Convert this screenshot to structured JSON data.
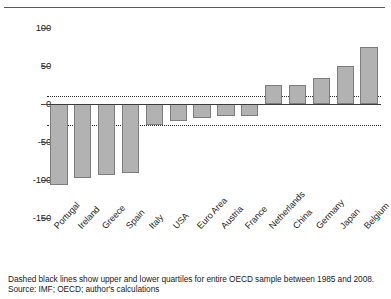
{
  "chart_data": {
    "type": "bar",
    "title": "",
    "subtitle": "",
    "xlabel": "",
    "ylabel": "",
    "categories": [
      "Portugal",
      "Ireland",
      "Greece",
      "Spain",
      "Italy",
      "USA",
      "Euro Area",
      "Austria",
      "France",
      "Netherlands",
      "China",
      "Germany",
      "Japan",
      "Belgium"
    ],
    "values": [
      -106,
      -98,
      -93,
      -91,
      -28,
      -22,
      -18,
      -16,
      -16,
      25,
      25,
      34,
      50,
      75
    ],
    "ylim": [
      -150,
      100
    ],
    "yticks": [
      100,
      50,
      0,
      -50,
      -100,
      -150
    ],
    "ytick_labels": [
      "100",
      "50",
      "0",
      "-50",
      "-100",
      "-150"
    ],
    "grid": false,
    "legend": "none",
    "bar_color": "#b2b2b2",
    "bar_edge_color": "#7d7d7d",
    "axis_color": "#3c3c3e",
    "annotations": [
      {
        "name": "upper-quartile",
        "value": 10,
        "style": "dotted"
      },
      {
        "name": "lower-quartile",
        "value": -28,
        "style": "dotted"
      }
    ]
  },
  "footnote": {
    "line1": "Dashed black lines show upper and lower quartiles for entire OECD sample between 1985 and 2008.",
    "line2": "Source: IMF; OECD; author's calculations"
  }
}
